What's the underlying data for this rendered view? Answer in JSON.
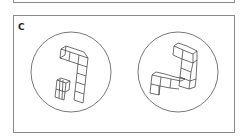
{
  "figure": {
    "panel_label": "C",
    "colors": {
      "border": "#8a8a8a",
      "stroke": "#333333",
      "background": "#ffffff"
    },
    "items": [
      {
        "name": "left-rotated-object",
        "circle": {
          "cx": 71,
          "cy": 72,
          "r": 40
        },
        "polylines": [
          "61,49 70,52 79,55 88,58 84,52 75,49 66,46 61,49",
          "61,49 60,58 69,61 78,64 87,67 88,58",
          "70,52 69,61",
          "79,55 78,64",
          "66,46 65,55 60,58",
          "78,64 77,73 86,76 87,67",
          "77,73 76,82 85,85 86,76",
          "76,82 75,91 84,94 85,85",
          "75,91 74,100 83,103 84,94",
          "57,80 61,78 70,81 66,83 57,80",
          "57,80 56,89 65,92 66,83",
          "65,92 69,90 70,81",
          "56,89 55,97 64,100 65,92",
          "60,79 59,98",
          "63,80 62,99"
        ]
      },
      {
        "name": "right-rotated-object",
        "circle": {
          "cx": 178,
          "cy": 72,
          "r": 40
        },
        "polylines": [
          "174,46 178,43 187,46 197,51 193,54 183,50 174,46",
          "174,46 173,55 182,59 183,50",
          "193,54 193,63 182,59",
          "197,51 197,60 193,63",
          "182,59 181,68 191,72 193,63",
          "181,68 180,77 190,81 191,72",
          "197,60 196,79 190,81",
          "180,77 179,86 189,89 190,81",
          "196,79 195,87 189,89",
          "152,75 156,72 165,74 175,77 185,79 181,81 171,79 161,77 152,75",
          "152,75 151,84 160,86 161,77",
          "160,86 170,88 171,79",
          "170,88 179,89",
          "151,84 150,93 159,95 160,86",
          "159,95 159,86"
        ]
      }
    ]
  }
}
